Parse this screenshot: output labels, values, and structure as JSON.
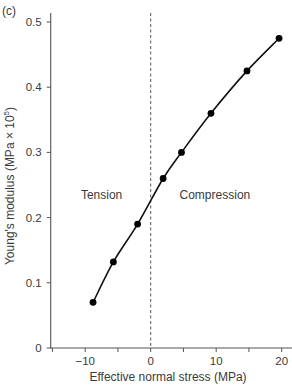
{
  "panel_label": "(c)",
  "chart_data": {
    "type": "line",
    "title": "",
    "xlabel": "Effective normal stress (MPa)",
    "ylabel_parts": {
      "main": "Young's modulus (MPa × 10",
      "sup": "5",
      "end": ")"
    },
    "ylabel": "Young's modulus (MPa × 10^5)",
    "xlim": [
      -15,
      21.5
    ],
    "ylim": [
      0,
      0.52
    ],
    "xticks": [
      -15,
      -10,
      -5,
      0,
      5,
      10,
      15,
      20
    ],
    "xtick_labels": [
      "",
      "−10",
      "",
      "0",
      "",
      "10",
      "",
      "20"
    ],
    "yticks": [
      0,
      0.1,
      0.2,
      0.3,
      0.4,
      0.5
    ],
    "ytick_labels": [
      "0",
      "0.1",
      "0.2",
      "0.3",
      "0.4",
      "0.5"
    ],
    "grid": false,
    "legend": null,
    "series": [
      {
        "name": "Young's modulus",
        "marker": "filled-circle",
        "line": "smooth",
        "x": [
          -8.8,
          -5.7,
          -2.0,
          1.9,
          4.7,
          9.2,
          14.7,
          19.6
        ],
        "y": [
          0.07,
          0.132,
          0.19,
          0.26,
          0.3,
          0.36,
          0.425,
          0.475
        ]
      }
    ],
    "reference_line": {
      "x": 0,
      "style": "dashed"
    },
    "annotations": [
      {
        "text": "Tension",
        "x": -7.5,
        "y": 0.235
      },
      {
        "text": "Compression",
        "x": 9.8,
        "y": 0.235
      }
    ]
  }
}
